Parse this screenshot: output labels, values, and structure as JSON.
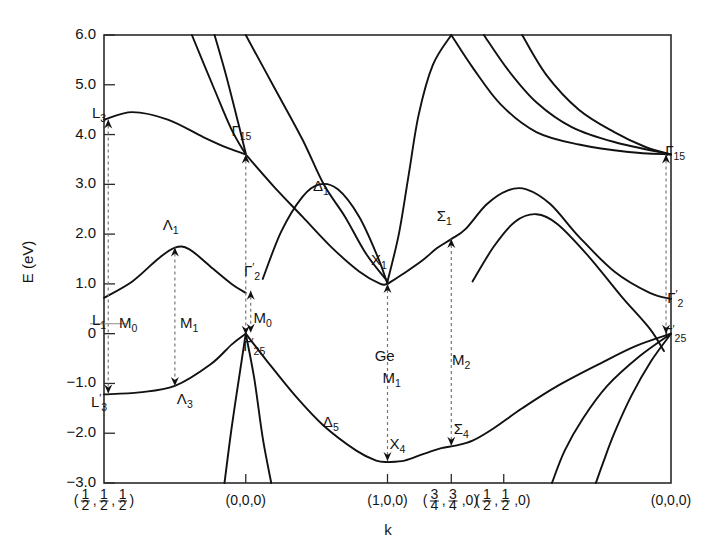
{
  "figure": {
    "material_label": "Ge",
    "axis": {
      "ylabel": "E (eV)",
      "xlabel": "k",
      "yticks": [
        "6.0",
        "5.0",
        "4.0",
        "3.0",
        "2.0",
        "1.0",
        "0",
        "-1.0",
        "-2.0",
        "-3.0"
      ],
      "ytick_values": [
        6.0,
        5.0,
        4.0,
        3.0,
        2.0,
        1.0,
        0,
        -1.0,
        -2.0,
        -3.0
      ],
      "ylim": [
        -3.0,
        6.0
      ],
      "xticks": [
        {
          "label_parts": [
            "(",
            "1/2",
            ",",
            "1/2",
            ",",
            "1/2",
            ")"
          ],
          "plain": "(1/2,1/2,1/2)",
          "x": 0.0
        },
        {
          "label_parts": [
            "(0,0,0)"
          ],
          "plain": "(0,0,0)",
          "x": 1.0
        },
        {
          "label_parts": [
            "(1,0,0)"
          ],
          "plain": "(1,0,0)",
          "x": 2.0
        },
        {
          "label_parts": [
            "(",
            "3/4",
            ",",
            "3/4",
            ",0)"
          ],
          "plain": "(3/4,3/4,0)",
          "x": 2.45
        },
        {
          "label_parts": [
            "(",
            "1/2",
            ",",
            "1/2",
            ",0)"
          ],
          "plain": "(1/2,1/2,0)",
          "x": 2.82
        },
        {
          "label_parts": [
            "(0,0,0)"
          ],
          "plain": "(0,0,0)",
          "x": 4.0
        }
      ]
    },
    "symmetry_labels": [
      {
        "name": "L3-upper",
        "text": "L",
        "sub": "3",
        "prime": false,
        "energy": 4.3
      },
      {
        "name": "L1",
        "text": "L",
        "sub": "1",
        "prime": false,
        "energy": 0.7
      },
      {
        "name": "L3-prime",
        "text": "L",
        "sub": "3",
        "prime": true,
        "energy": -1.2
      },
      {
        "name": "Lambda1",
        "text": "Λ",
        "sub": "1",
        "prime": false,
        "energy": 1.75
      },
      {
        "name": "Lambda3",
        "text": "Λ",
        "sub": "3",
        "prime": false,
        "energy": -1.05
      },
      {
        "name": "Gamma15",
        "text": "Γ",
        "sub": "15",
        "prime": false,
        "energy": 3.6
      },
      {
        "name": "Gamma2-prime",
        "text": "Γ",
        "sub": "2",
        "prime": true,
        "energy": 0.9
      },
      {
        "name": "Gamma25-prime",
        "text": "Γ",
        "sub": "25",
        "prime": true,
        "energy": 0.0
      },
      {
        "name": "Delta1",
        "text": "Δ",
        "sub": "1",
        "prime": false,
        "energy": 2.75
      },
      {
        "name": "Delta5",
        "text": "Δ",
        "sub": "5",
        "prime": false,
        "energy": -1.85
      },
      {
        "name": "X1",
        "text": "X",
        "sub": "1",
        "prime": false,
        "energy": 1.0
      },
      {
        "name": "X4",
        "text": "X",
        "sub": "4",
        "prime": false,
        "energy": -2.55
      },
      {
        "name": "Sigma1",
        "text": "Σ",
        "sub": "1",
        "prime": false,
        "energy": 1.9
      },
      {
        "name": "Sigma4",
        "text": "Σ",
        "sub": "4",
        "prime": false,
        "energy": -2.25
      },
      {
        "name": "Gamma15-right",
        "text": "Γ",
        "sub": "15",
        "prime": false,
        "energy": 3.6
      },
      {
        "name": "Gamma2-prime-right",
        "text": "Γ",
        "sub": "2",
        "prime": true,
        "energy": 0.7
      },
      {
        "name": "Gamma25-prime-right",
        "text": "Γ",
        "sub": "25",
        "prime": true,
        "energy": 0.0
      }
    ],
    "critical_points": [
      {
        "name": "M0-left",
        "text": "M",
        "sub": "0",
        "from_energy": 4.3,
        "to_energy": -1.2
      },
      {
        "name": "M1-lambda",
        "text": "M",
        "sub": "1",
        "from_energy": 1.75,
        "to_energy": -1.05
      },
      {
        "name": "M0-gamma",
        "text": "M",
        "sub": "0",
        "from_energy": 0.9,
        "to_energy": 0.0
      },
      {
        "name": "M0-gamma15",
        "text": "M",
        "sub": "0",
        "from_energy": 3.6,
        "to_energy": 0.0
      },
      {
        "name": "M1-X",
        "text": "M",
        "sub": "1",
        "from_energy": 1.0,
        "to_energy": -2.55
      },
      {
        "name": "M2-Sigma",
        "text": "M",
        "sub": "2",
        "from_energy": 1.9,
        "to_energy": -2.25
      },
      {
        "name": "M-right",
        "text": "",
        "sub": "",
        "from_energy": 3.6,
        "to_energy": 0.0
      }
    ]
  },
  "chart_data": {
    "type": "line",
    "title": "",
    "subtitle": "",
    "xlabel": "k",
    "ylabel": "E (eV)",
    "ylim": [
      -3.0,
      6.0
    ],
    "xlim": [
      0.0,
      4.0
    ],
    "grid": false,
    "legend": "none",
    "annotations": [
      {
        "text": "Ge",
        "x": 2.0,
        "y": -0.55
      },
      {
        "text": "L3",
        "x": 0.0,
        "y": 4.3
      },
      {
        "text": "L1",
        "x": 0.0,
        "y": 0.25
      },
      {
        "text": "L3'",
        "x": 0.0,
        "y": -1.45
      },
      {
        "text": "Λ1",
        "x": 0.48,
        "y": 2.05
      },
      {
        "text": "Λ3",
        "x": 0.55,
        "y": -1.4
      },
      {
        "text": "Γ15",
        "x": 1.0,
        "y": 3.95
      },
      {
        "text": "Γ2'",
        "x": 1.02,
        "y": 1.15
      },
      {
        "text": "Γ25'",
        "x": 1.07,
        "y": -0.3
      },
      {
        "text": "Δ1",
        "x": 1.55,
        "y": 2.85
      },
      {
        "text": "Δ5",
        "x": 1.6,
        "y": -1.85
      },
      {
        "text": "X1",
        "x": 1.95,
        "y": 1.35
      },
      {
        "text": "X4",
        "x": 2.05,
        "y": -2.35
      },
      {
        "text": "Σ1",
        "x": 2.42,
        "y": 2.25
      },
      {
        "text": "Σ4",
        "x": 2.5,
        "y": -2.05
      },
      {
        "text": "M0",
        "x": 0.15,
        "y": 0.2
      },
      {
        "text": "M1",
        "x": 0.62,
        "y": 0.2
      },
      {
        "text": "M0",
        "x": 1.22,
        "y": 0.3
      },
      {
        "text": "M1",
        "x": 2.05,
        "y": -0.95
      },
      {
        "text": "M2",
        "x": 2.58,
        "y": -0.55
      },
      {
        "text": "Γ15",
        "x": 4.0,
        "y": 3.6
      },
      {
        "text": "Γ2'",
        "x": 4.0,
        "y": 0.7
      },
      {
        "text": "Γ25'",
        "x": 4.0,
        "y": 0.0
      }
    ],
    "series": [
      {
        "name": "L3-upper-conduction",
        "points": [
          [
            0.0,
            4.3
          ],
          [
            0.2,
            4.45
          ],
          [
            0.45,
            4.3
          ],
          [
            0.7,
            3.95
          ],
          [
            0.88,
            3.72
          ],
          [
            1.0,
            3.6
          ]
        ]
      },
      {
        "name": "Lambda1-L1-conduction",
        "points": [
          [
            0.0,
            0.72
          ],
          [
            0.2,
            1.05
          ],
          [
            0.38,
            1.5
          ],
          [
            0.5,
            1.73
          ],
          [
            0.6,
            1.7
          ],
          [
            0.75,
            1.35
          ],
          [
            0.9,
            1.0
          ],
          [
            1.0,
            0.82
          ]
        ]
      },
      {
        "name": "Lambda3-valence",
        "points": [
          [
            0.0,
            -1.22
          ],
          [
            0.25,
            -1.18
          ],
          [
            0.5,
            -1.05
          ],
          [
            0.75,
            -0.62
          ],
          [
            0.9,
            -0.22
          ],
          [
            1.0,
            0.0
          ]
        ]
      },
      {
        "name": "Gamma15-steep-upper",
        "points": [
          [
            0.62,
            6.0
          ],
          [
            0.78,
            4.9
          ],
          [
            0.9,
            4.1
          ],
          [
            1.0,
            3.6
          ]
        ]
      },
      {
        "name": "Delta1-conduction",
        "points": [
          [
            1.0,
            3.6
          ],
          [
            1.2,
            2.95
          ],
          [
            1.4,
            2.35
          ],
          [
            1.6,
            1.75
          ],
          [
            1.8,
            1.25
          ],
          [
            1.95,
            1.0
          ],
          [
            2.0,
            1.0
          ]
        ]
      },
      {
        "name": "Delta-upper-branch",
        "points": [
          [
            1.0,
            6.0
          ],
          [
            1.2,
            4.95
          ],
          [
            1.4,
            3.9
          ],
          [
            1.55,
            3.0
          ],
          [
            1.7,
            2.35
          ],
          [
            1.85,
            1.6
          ],
          [
            2.0,
            1.05
          ]
        ]
      },
      {
        "name": "Delta2-hump",
        "points": [
          [
            1.12,
            1.1
          ],
          [
            1.25,
            2.05
          ],
          [
            1.4,
            2.75
          ],
          [
            1.52,
            3.0
          ],
          [
            1.65,
            2.9
          ],
          [
            1.8,
            2.35
          ],
          [
            1.93,
            1.55
          ],
          [
            2.0,
            1.0
          ]
        ]
      },
      {
        "name": "Delta5-valence",
        "points": [
          [
            1.0,
            0.0
          ],
          [
            1.15,
            -0.55
          ],
          [
            1.35,
            -1.25
          ],
          [
            1.55,
            -1.85
          ],
          [
            1.78,
            -2.35
          ],
          [
            1.92,
            -2.55
          ],
          [
            2.0,
            -2.58
          ]
        ]
      },
      {
        "name": "Gamma25-heavy-down-left",
        "points": [
          [
            1.0,
            0.0
          ],
          [
            1.06,
            -0.9
          ],
          [
            1.12,
            -2.1
          ],
          [
            1.18,
            -3.0
          ]
        ]
      },
      {
        "name": "Gamma25-light-down-left2",
        "points": [
          [
            1.0,
            0.0
          ],
          [
            0.96,
            -0.75
          ],
          [
            0.9,
            -1.9
          ],
          [
            0.85,
            -3.0
          ]
        ]
      },
      {
        "name": "Gamma-conduction-steep-leftside",
        "points": [
          [
            0.78,
            6.0
          ],
          [
            0.86,
            5.2
          ],
          [
            0.95,
            4.2
          ],
          [
            1.0,
            3.62
          ]
        ]
      },
      {
        "name": "X1-Sigma1-conduction",
        "points": [
          [
            2.0,
            1.0
          ],
          [
            2.12,
            1.22
          ],
          [
            2.25,
            1.48
          ],
          [
            2.35,
            1.72
          ],
          [
            2.45,
            1.9
          ],
          [
            2.55,
            2.1
          ],
          [
            2.7,
            2.6
          ],
          [
            2.85,
            2.88
          ],
          [
            2.98,
            2.9
          ],
          [
            3.15,
            2.6
          ],
          [
            3.35,
            1.95
          ],
          [
            3.6,
            1.25
          ],
          [
            3.85,
            0.82
          ],
          [
            4.0,
            0.7
          ]
        ]
      },
      {
        "name": "X1-steep-conduction-up",
        "points": [
          [
            2.0,
            1.05
          ],
          [
            2.08,
            2.0
          ],
          [
            2.15,
            3.2
          ],
          [
            2.22,
            4.4
          ],
          [
            2.32,
            5.4
          ],
          [
            2.45,
            6.0
          ]
        ]
      },
      {
        "name": "X-upper-to-Gamma15-a",
        "points": [
          [
            2.45,
            6.0
          ],
          [
            2.6,
            5.35
          ],
          [
            2.8,
            4.6
          ],
          [
            3.05,
            4.05
          ],
          [
            3.35,
            3.8
          ],
          [
            3.7,
            3.65
          ],
          [
            4.0,
            3.6
          ]
        ]
      },
      {
        "name": "X-upper-to-Gamma15-b",
        "points": [
          [
            2.68,
            6.0
          ],
          [
            2.85,
            5.3
          ],
          [
            3.05,
            4.65
          ],
          [
            3.3,
            4.15
          ],
          [
            3.6,
            3.85
          ],
          [
            4.0,
            3.6
          ]
        ]
      },
      {
        "name": "X-upper-to-Gamma15-c",
        "points": [
          [
            2.95,
            6.0
          ],
          [
            3.12,
            5.2
          ],
          [
            3.35,
            4.5
          ],
          [
            3.6,
            4.05
          ],
          [
            3.82,
            3.75
          ],
          [
            4.0,
            3.6
          ]
        ]
      },
      {
        "name": "X4-Sigma4-valence",
        "points": [
          [
            2.0,
            -2.58
          ],
          [
            2.12,
            -2.55
          ],
          [
            2.25,
            -2.42
          ],
          [
            2.38,
            -2.3
          ],
          [
            2.48,
            -2.25
          ],
          [
            2.6,
            -2.15
          ],
          [
            2.75,
            -1.9
          ],
          [
            2.95,
            -1.5
          ],
          [
            3.2,
            -1.05
          ],
          [
            3.5,
            -0.6
          ],
          [
            3.75,
            -0.25
          ],
          [
            4.0,
            0.0
          ]
        ]
      },
      {
        "name": "Gamma25-valence-b-right",
        "points": [
          [
            4.0,
            0.0
          ],
          [
            3.78,
            -0.45
          ],
          [
            3.55,
            -1.05
          ],
          [
            3.38,
            -1.7
          ],
          [
            3.25,
            -2.35
          ],
          [
            3.16,
            -3.0
          ]
        ]
      },
      {
        "name": "Gamma25-valence-c-right",
        "points": [
          [
            4.0,
            0.0
          ],
          [
            3.86,
            -0.55
          ],
          [
            3.72,
            -1.25
          ],
          [
            3.6,
            -2.0
          ],
          [
            3.52,
            -2.6
          ],
          [
            3.47,
            -3.0
          ]
        ]
      },
      {
        "name": "Gamma2prime-from-sigma",
        "points": [
          [
            2.6,
            1.05
          ],
          [
            2.75,
            1.75
          ],
          [
            2.9,
            2.25
          ],
          [
            3.05,
            2.4
          ],
          [
            3.2,
            2.2
          ],
          [
            3.42,
            1.55
          ],
          [
            3.65,
            0.75
          ],
          [
            3.85,
            0.1
          ],
          [
            3.95,
            -0.35
          ]
        ]
      }
    ]
  }
}
